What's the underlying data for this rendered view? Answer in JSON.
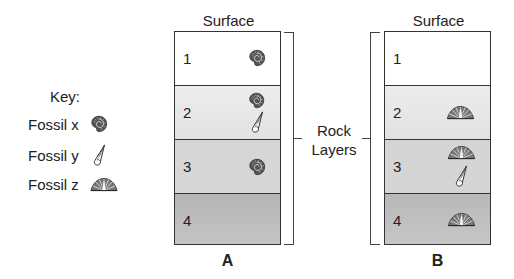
{
  "key": {
    "title": "Key:",
    "items": [
      {
        "label": "Fossil x",
        "icon": "ammonite-icon"
      },
      {
        "label": "Fossil y",
        "icon": "cone-shell-icon"
      },
      {
        "label": "Fossil z",
        "icon": "fan-shell-icon"
      }
    ]
  },
  "columns": [
    {
      "name": "A",
      "top_label": "Surface",
      "layers": [
        {
          "number": "1",
          "fossils": [
            "x"
          ]
        },
        {
          "number": "2",
          "fossils": [
            "x",
            "y"
          ]
        },
        {
          "number": "3",
          "fossils": [
            "x"
          ]
        },
        {
          "number": "4",
          "fossils": []
        }
      ]
    },
    {
      "name": "B",
      "top_label": "Surface",
      "layers": [
        {
          "number": "1",
          "fossils": []
        },
        {
          "number": "2",
          "fossils": [
            "z"
          ]
        },
        {
          "number": "3",
          "fossils": [
            "z",
            "y"
          ]
        },
        {
          "number": "4",
          "fossils": [
            "z"
          ]
        }
      ]
    }
  ],
  "bracket_label": {
    "line1": "Rock",
    "line2": "Layers"
  },
  "colors": {
    "layer1": "#ffffff",
    "layer2": "#e6e6e6",
    "layer3": "#d5d5d5",
    "layer4": "#b9b9b9",
    "outline": "#333333"
  }
}
